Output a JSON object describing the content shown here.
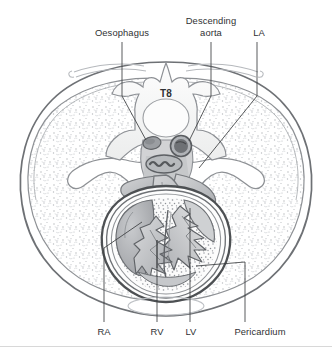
{
  "figure": {
    "view": "axial CT-style anatomical cross-section",
    "vertebra_label": "T8",
    "background_color": "#ffffff",
    "line_color": "#3b3d40",
    "label_color": "#2f3133"
  },
  "labels": {
    "oesophagus": "Oesophagus",
    "descending_aorta_line1": "Descending",
    "descending_aorta_line2": "aorta",
    "la": "LA",
    "t8": "T8",
    "ra": "RA",
    "rv": "RV",
    "lv": "LV",
    "pericardium": "Pericardium"
  },
  "annotations": [
    {
      "id": "oesophagus",
      "text": "Oesophagus",
      "position": "top",
      "leader_x": 122,
      "leader_y_start": 42,
      "leader_y_end": 136
    },
    {
      "id": "descending-aorta",
      "text": "Descending aorta",
      "position": "top",
      "leader_x": 211,
      "leader_y_start": 42,
      "leader_y_end": 136
    },
    {
      "id": "la",
      "text": "LA",
      "position": "top",
      "leader_x": 257,
      "leader_y_start": 42,
      "leader_y_end": 178
    },
    {
      "id": "ra",
      "text": "RA",
      "position": "bottom",
      "leader_x": 104,
      "leader_y_start": 248,
      "leader_y_end": 322
    },
    {
      "id": "rv",
      "text": "RV",
      "position": "bottom",
      "leader_x": 157,
      "leader_y_start": 240,
      "leader_y_end": 322
    },
    {
      "id": "lv",
      "text": "LV",
      "position": "bottom",
      "leader_x": 190,
      "leader_y_start": 218,
      "leader_y_end": 322
    },
    {
      "id": "pericardium",
      "text": "Pericardium",
      "position": "bottom",
      "leader_x": 245,
      "leader_y_start": 262,
      "leader_y_end": 322
    }
  ],
  "structures": [
    {
      "name": "thoracic-wall",
      "description": "outer chest wall outline"
    },
    {
      "name": "left-lung",
      "description": "stippled lung field, patient left"
    },
    {
      "name": "right-lung",
      "description": "stippled lung field, patient right"
    },
    {
      "name": "vertebra-t8",
      "description": "T8 vertebral body, laminae and spinous process"
    },
    {
      "name": "oesophagus",
      "description": "small oval anterior to vertebral body"
    },
    {
      "name": "descending-aorta",
      "description": "dark round vessel left of the vertebral body"
    },
    {
      "name": "spinal-canal",
      "description": "spinal cord within vertebral canal"
    },
    {
      "name": "pericardium",
      "description": "layered sac surrounding the heart"
    },
    {
      "name": "right-atrium",
      "description": "RA chamber"
    },
    {
      "name": "right-ventricle",
      "description": "RV chamber, trabeculated"
    },
    {
      "name": "left-ventricle",
      "description": "LV chamber, thick trabeculated wall"
    },
    {
      "name": "left-atrium",
      "description": "LA chamber"
    },
    {
      "name": "interventricular-septum",
      "description": "septum between ventricles"
    },
    {
      "name": "ribs",
      "description": "posterior rib pair at top"
    },
    {
      "name": "diaphragm-shadow",
      "description": "faint ellipse beneath the heart"
    }
  ]
}
